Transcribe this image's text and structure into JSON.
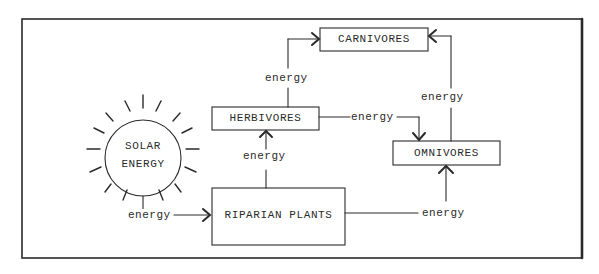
{
  "diagram": {
    "title": "",
    "nodes": {
      "solar": {
        "line1": "SOLAR",
        "line2": "ENERGY"
      },
      "carnivores": "CARNIVORES",
      "herbivores": "HERBIVORES",
      "omnivores": "OMNIVORES",
      "plants": "RIPARIAN PLANTS"
    },
    "edges": [
      {
        "from": "solar",
        "to": "plants",
        "label": "energy"
      },
      {
        "from": "plants",
        "to": "herbivores",
        "label": "energy"
      },
      {
        "from": "plants",
        "to": "omnivores",
        "label": "energy"
      },
      {
        "from": "herbivores",
        "to": "carnivores",
        "label": "energy"
      },
      {
        "from": "herbivores",
        "to": "omnivores",
        "label": "energy"
      },
      {
        "from": "omnivores",
        "to": "carnivores",
        "label": "energy"
      }
    ],
    "colors": {
      "ink": "#2a2a2a",
      "background": "#ffffff"
    }
  }
}
